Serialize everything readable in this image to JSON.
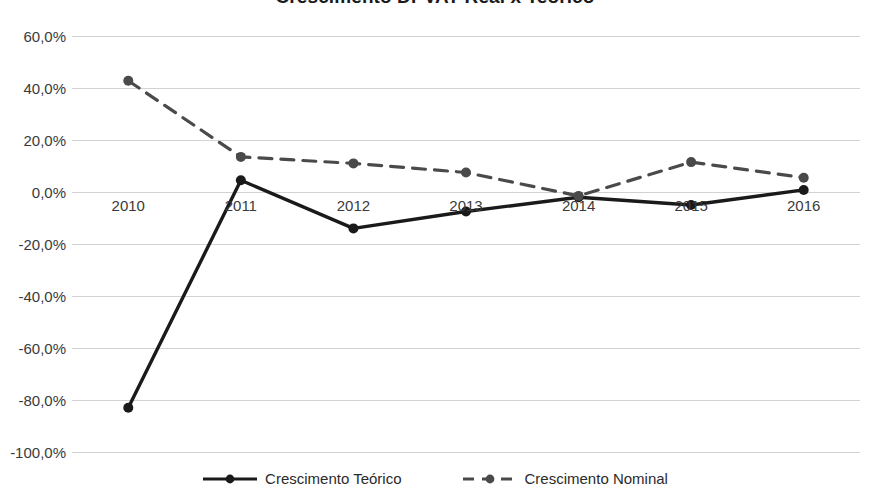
{
  "chart_data": {
    "type": "line",
    "title": "Crescimento DPVAT Real x Teórico",
    "xlabel": "",
    "ylabel": "",
    "categories": [
      "2010",
      "2011",
      "2012",
      "2013",
      "2014",
      "2015",
      "2016"
    ],
    "series": [
      {
        "name": "Crescimento Teórico",
        "style": "solid",
        "color": "#1a1a1a",
        "marker": "circle",
        "values": [
          -83.0,
          4.5,
          -14.0,
          -7.5,
          -2.0,
          -5.0,
          0.8
        ]
      },
      {
        "name": "Crescimento Nominal",
        "style": "dashed",
        "color": "#4a4a4a",
        "marker": "circle",
        "values": [
          42.8,
          13.5,
          11.0,
          7.5,
          -1.5,
          11.5,
          5.5
        ]
      }
    ],
    "ylim": [
      -100.0,
      60.0
    ],
    "ytick_step": 20.0,
    "ytick_labels": [
      "60,0%",
      "40,0%",
      "20,0%",
      "0,0%",
      "-20,0%",
      "-40,0%",
      "-60,0%",
      "-80,0%",
      "-100,0%"
    ],
    "ytick_values": [
      60,
      40,
      20,
      0,
      -20,
      -40,
      -60,
      -80,
      -100
    ],
    "grid": true,
    "legend_position": "bottom",
    "value_format": "percent-comma"
  },
  "legend": {
    "items": [
      {
        "label": "Crescimento Teórico"
      },
      {
        "label": "Crescimento Nominal"
      }
    ]
  }
}
